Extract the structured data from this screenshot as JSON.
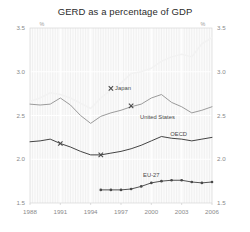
{
  "chart_data": {
    "type": "line",
    "title": "GERD as a percentage of GDP",
    "xlabel": "",
    "ylabel": "",
    "unit_label": "%",
    "xlim": [
      1988,
      2006
    ],
    "ylim": [
      1.5,
      3.5
    ],
    "xticks": [
      "1988",
      "1991",
      "1994",
      "1997",
      "2000",
      "2003",
      "2006"
    ],
    "xtick_values": [
      1988,
      1991,
      1994,
      1997,
      2000,
      2003,
      2006
    ],
    "yticks": [
      "1.5",
      "2.0",
      "2.5",
      "3.0",
      "3.5"
    ],
    "ytick_values": [
      1.5,
      2.0,
      2.5,
      3.0,
      3.5
    ],
    "grid": true,
    "grid_orientation": "both",
    "legend": "inline-annotations",
    "series": [
      {
        "name": "Japan",
        "color": "#f2f2f2",
        "label_x": 1997.2,
        "label_y": 2.81,
        "marker_x": 1996.0,
        "marker_y": 2.81,
        "marker": "x",
        "x": [
          1988,
          1989,
          1990,
          1991,
          1992,
          1993,
          1994,
          1995,
          1996,
          1997,
          1998,
          1999,
          2000,
          2001,
          2002,
          2003,
          2004,
          2005,
          2006
        ],
        "values": [
          2.66,
          2.7,
          2.76,
          2.74,
          2.7,
          2.64,
          2.58,
          2.7,
          2.79,
          2.87,
          2.98,
          3.0,
          3.04,
          3.12,
          3.17,
          3.2,
          3.17,
          3.32,
          3.39
        ]
      },
      {
        "name": "United States",
        "color": "#9b9b9b",
        "label_x": 2000.6,
        "label_y": 2.48,
        "marker_x": 1998.0,
        "marker_y": 2.61,
        "marker": "x",
        "x": [
          1988,
          1989,
          1990,
          1991,
          1992,
          1993,
          1994,
          1995,
          1996,
          1997,
          1998,
          1999,
          2000,
          2001,
          2002,
          2003,
          2004,
          2005,
          2006
        ],
        "values": [
          2.63,
          2.62,
          2.63,
          2.7,
          2.62,
          2.5,
          2.41,
          2.49,
          2.53,
          2.56,
          2.6,
          2.63,
          2.7,
          2.74,
          2.65,
          2.6,
          2.53,
          2.56,
          2.6
        ]
      },
      {
        "name": "OECD",
        "color": "#3a3a3a",
        "label_x": 2002.7,
        "label_y": 2.29,
        "marker_x": 1991.0,
        "marker_y": 2.18,
        "marker2_x": 1995.0,
        "marker2_y": 2.05,
        "marker": "x",
        "x": [
          1988,
          1989,
          1990,
          1991,
          1992,
          1993,
          1994,
          1995,
          1996,
          1997,
          1998,
          1999,
          2000,
          2001,
          2002,
          2003,
          2004,
          2005,
          2006
        ],
        "values": [
          2.2,
          2.21,
          2.23,
          2.18,
          2.14,
          2.09,
          2.05,
          2.05,
          2.07,
          2.09,
          2.12,
          2.16,
          2.21,
          2.26,
          2.24,
          2.23,
          2.21,
          2.23,
          2.25
        ]
      },
      {
        "name": "EU-27",
        "color": "#4a4a4a",
        "label_x": 2000.0,
        "label_y": 1.82,
        "marker": "circle",
        "x": [
          1995,
          1996,
          1997,
          1998,
          1999,
          2000,
          2001,
          2002,
          2003,
          2004,
          2005,
          2006
        ],
        "values": [
          1.65,
          1.65,
          1.65,
          1.66,
          1.69,
          1.73,
          1.75,
          1.76,
          1.76,
          1.74,
          1.73,
          1.74
        ]
      }
    ]
  },
  "colors": {
    "background": "#ffffff",
    "plot_background": "#fbfbfb",
    "grid": "#ededed",
    "axis_text": "#8a8a8a",
    "title_text": "#2b2b2b"
  }
}
